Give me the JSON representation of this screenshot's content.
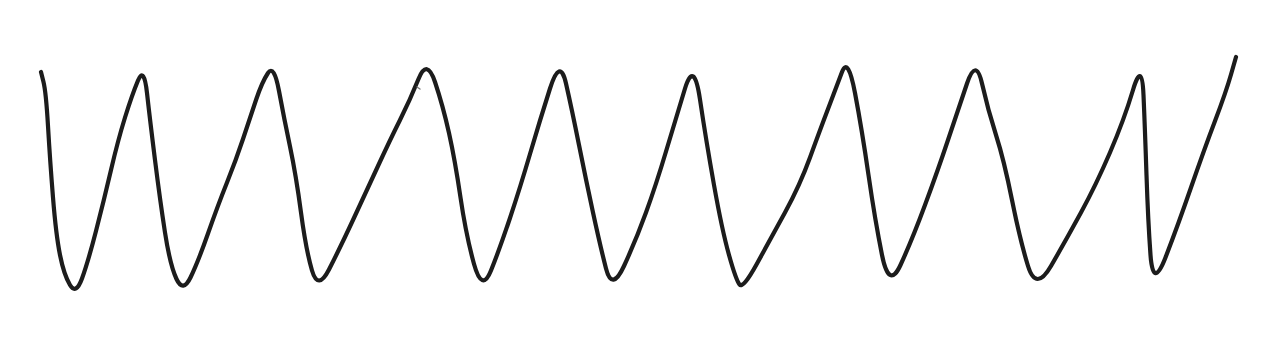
{
  "figure": {
    "background": "#ffffff",
    "stroke_color": "#1c1c1c",
    "stroke_width": 4.2,
    "points": [
      [
        41,
        72
      ],
      [
        46,
        92
      ],
      [
        50,
        160
      ],
      [
        56,
        235
      ],
      [
        64,
        275
      ],
      [
        76,
        295
      ],
      [
        88,
        262
      ],
      [
        104,
        200
      ],
      [
        118,
        140
      ],
      [
        132,
        95
      ],
      [
        144,
        66
      ],
      [
        150,
        120
      ],
      [
        160,
        200
      ],
      [
        170,
        265
      ],
      [
        183,
        293
      ],
      [
        198,
        262
      ],
      [
        218,
        205
      ],
      [
        236,
        160
      ],
      [
        250,
        118
      ],
      [
        262,
        82
      ],
      [
        274,
        64
      ],
      [
        284,
        118
      ],
      [
        296,
        175
      ],
      [
        306,
        250
      ],
      [
        318,
        291
      ],
      [
        340,
        248
      ],
      [
        366,
        192
      ],
      [
        390,
        140
      ],
      [
        410,
        100
      ],
      [
        427,
        58
      ],
      [
        443,
        106
      ],
      [
        455,
        160
      ],
      [
        466,
        235
      ],
      [
        482,
        293
      ],
      [
        500,
        248
      ],
      [
        520,
        188
      ],
      [
        540,
        120
      ],
      [
        560,
        57
      ],
      [
        572,
        110
      ],
      [
        586,
        180
      ],
      [
        600,
        245
      ],
      [
        612,
        292
      ],
      [
        636,
        240
      ],
      [
        656,
        185
      ],
      [
        676,
        118
      ],
      [
        694,
        59
      ],
      [
        706,
        140
      ],
      [
        722,
        230
      ],
      [
        736,
        280
      ],
      [
        743,
        289
      ],
      [
        770,
        240
      ],
      [
        800,
        185
      ],
      [
        820,
        130
      ],
      [
        836,
        88
      ],
      [
        848,
        56
      ],
      [
        862,
        130
      ],
      [
        875,
        220
      ],
      [
        889,
        290
      ],
      [
        912,
        240
      ],
      [
        938,
        170
      ],
      [
        958,
        110
      ],
      [
        976,
        57
      ],
      [
        988,
        110
      ],
      [
        1004,
        160
      ],
      [
        1020,
        240
      ],
      [
        1036,
        292
      ],
      [
        1066,
        240
      ],
      [
        1096,
        185
      ],
      [
        1124,
        120
      ],
      [
        1142,
        60
      ],
      [
        1145,
        130
      ],
      [
        1148,
        220
      ],
      [
        1153,
        290
      ],
      [
        1178,
        225
      ],
      [
        1204,
        150
      ],
      [
        1226,
        92
      ],
      [
        1236,
        57
      ]
    ],
    "stray_mark": {
      "x1": 417,
      "y1": 87,
      "x2": 420,
      "y2": 89,
      "color": "#7a7a7a",
      "width": 1.4
    }
  }
}
